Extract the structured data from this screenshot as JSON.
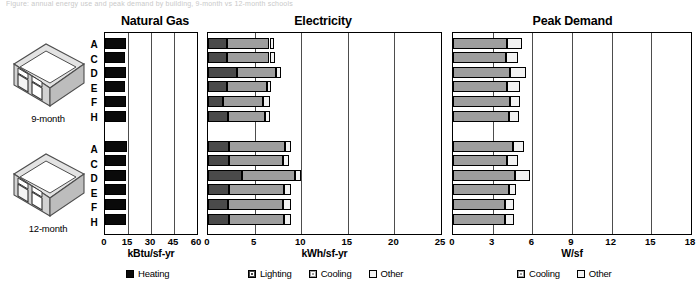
{
  "top_caption": "Figure: annual energy use and peak demand by building, 9-month vs 12-month schools",
  "icons": [
    {
      "name": "building-9-month",
      "label": "9-month"
    },
    {
      "name": "building-12-month",
      "label": "12-month"
    }
  ],
  "row_labels": [
    "A",
    "C",
    "D",
    "E",
    "F",
    "H"
  ],
  "panels": {
    "gas": {
      "title": "Natural Gas",
      "axis_title": "kBtu/sf-yr"
    },
    "elec": {
      "title": "Electricity",
      "axis_title": "kWh/sf-yr"
    },
    "peak": {
      "title": "Peak Demand",
      "axis_title": "W/sf"
    }
  },
  "legends": {
    "gas": [
      {
        "label": "Heating",
        "color": "#0a0a0a"
      }
    ],
    "elec": [
      {
        "label": "Lighting",
        "color": "#4a4a4a"
      },
      {
        "label": "Cooling",
        "color": "#9e9e9e"
      },
      {
        "label": "Other",
        "color": "#f2f2f2"
      }
    ],
    "peak": [
      {
        "label": "Cooling",
        "color": "#9e9e9e"
      },
      {
        "label": "Other",
        "color": "#f2f2f2"
      }
    ]
  },
  "chart_data": [
    {
      "type": "bar",
      "title": "Natural Gas",
      "orientation": "horizontal",
      "stacked": true,
      "xlabel": "kBtu/sf-yr",
      "ylabel": "",
      "xlim": [
        0,
        60
      ],
      "xticks": [
        0,
        15,
        30,
        45,
        60
      ],
      "grid": true,
      "legend_position": "bottom",
      "groups": [
        "9-month",
        "12-month"
      ],
      "categories": [
        "A",
        "C",
        "D",
        "E",
        "F",
        "H"
      ],
      "series": [
        {
          "name": "Heating",
          "color": "#0a0a0a",
          "values_9_month": [
            13.5,
            13.0,
            13.5,
            13.0,
            13.5,
            13.5
          ],
          "values_12_month": [
            14.5,
            13.5,
            14.0,
            14.0,
            14.0,
            13.5
          ]
        }
      ]
    },
    {
      "type": "bar",
      "title": "Electricity",
      "orientation": "horizontal",
      "stacked": true,
      "xlabel": "kWh/sf-yr",
      "ylabel": "",
      "xlim": [
        0,
        25
      ],
      "xticks": [
        0,
        5,
        10,
        15,
        20,
        25
      ],
      "grid": true,
      "legend_position": "bottom",
      "groups": [
        "9-month",
        "12-month"
      ],
      "categories": [
        "A",
        "C",
        "D",
        "E",
        "F",
        "H"
      ],
      "series": [
        {
          "name": "Lighting",
          "color": "#4a4a4a",
          "values_9_month": [
            2.0,
            2.0,
            3.1,
            2.0,
            1.6,
            2.1
          ],
          "values_12_month": [
            2.3,
            2.3,
            3.7,
            2.3,
            2.1,
            2.3
          ]
        },
        {
          "name": "Cooling",
          "color": "#9e9e9e",
          "values_9_month": [
            4.6,
            4.6,
            4.2,
            4.3,
            4.3,
            4.0
          ],
          "values_12_month": [
            6.0,
            5.7,
            5.6,
            5.9,
            5.9,
            5.9
          ]
        },
        {
          "name": "Other",
          "color": "#f2f2f2",
          "values_9_month": [
            0.5,
            0.6,
            0.5,
            0.5,
            0.7,
            0.6
          ],
          "values_12_month": [
            0.6,
            0.7,
            0.7,
            0.7,
            0.9,
            0.7
          ]
        }
      ]
    },
    {
      "type": "bar",
      "title": "Peak Demand",
      "orientation": "horizontal",
      "stacked": true,
      "xlabel": "W/sf",
      "ylabel": "",
      "xlim": [
        0,
        18
      ],
      "xticks": [
        0,
        3,
        6,
        9,
        12,
        15,
        18
      ],
      "grid": true,
      "legend_position": "bottom",
      "groups": [
        "9-month",
        "12-month"
      ],
      "categories": [
        "A",
        "C",
        "D",
        "E",
        "F",
        "H"
      ],
      "series": [
        {
          "name": "Cooling",
          "color": "#9e9e9e",
          "values_9_month": [
            4.1,
            4.0,
            4.3,
            4.1,
            4.3,
            4.2
          ],
          "values_12_month": [
            4.5,
            4.1,
            4.7,
            4.2,
            3.9,
            3.9
          ]
        },
        {
          "name": "Other",
          "color": "#f2f2f2",
          "values_9_month": [
            1.1,
            0.9,
            1.2,
            1.0,
            0.8,
            0.8
          ],
          "values_12_month": [
            0.9,
            0.8,
            1.1,
            0.6,
            0.7,
            0.7
          ]
        }
      ]
    }
  ]
}
